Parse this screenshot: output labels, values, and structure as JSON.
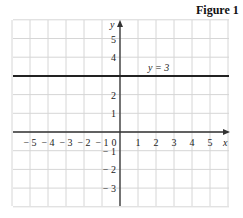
{
  "figure": {
    "title": "Figure 1"
  },
  "chart_data": {
    "type": "line",
    "title": "Figure 1",
    "xlabel": "x",
    "ylabel": "y",
    "xlim": [
      -6,
      6
    ],
    "ylim": [
      -4,
      6
    ],
    "grid": true,
    "x_ticks": [
      "-5",
      "-4",
      "-3",
      "-2",
      "-1",
      "0",
      "1",
      "2",
      "3",
      "4",
      "5"
    ],
    "y_ticks": [
      "5",
      "4",
      "2",
      "1",
      "-1",
      "-2",
      "-3"
    ],
    "series": [
      {
        "name": "y = 3",
        "x": [
          -6,
          6
        ],
        "y": [
          3,
          3
        ]
      }
    ],
    "annotations": [
      {
        "text": "y = 3",
        "x": 1.8,
        "y": 3.3
      }
    ]
  }
}
